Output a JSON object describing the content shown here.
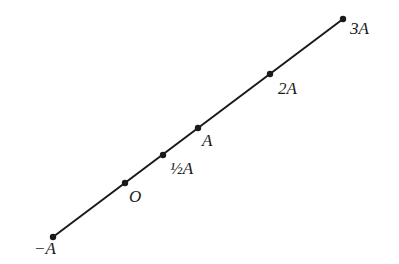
{
  "diagram": {
    "type": "number-line",
    "line_color": "#1a1a1a",
    "line": {
      "x1": 53,
      "y1": 237,
      "x2": 343,
      "y2": 19
    },
    "points": [
      {
        "id": "neg-a",
        "label": "−A",
        "x": 53,
        "y": 237,
        "lx": 34,
        "ly": 240
      },
      {
        "id": "origin",
        "label": "O",
        "x": 125,
        "y": 183,
        "lx": 129,
        "ly": 188
      },
      {
        "id": "half-a",
        "label": "½A",
        "x": 163,
        "y": 155,
        "lx": 170,
        "ly": 160
      },
      {
        "id": "a",
        "label": "A",
        "x": 198,
        "y": 128,
        "lx": 202,
        "ly": 132
      },
      {
        "id": "two-a",
        "label": "2A",
        "x": 270,
        "y": 74,
        "lx": 278,
        "ly": 80
      },
      {
        "id": "three-a",
        "label": "3A",
        "x": 343,
        "y": 19,
        "lx": 350,
        "ly": 20
      }
    ]
  }
}
